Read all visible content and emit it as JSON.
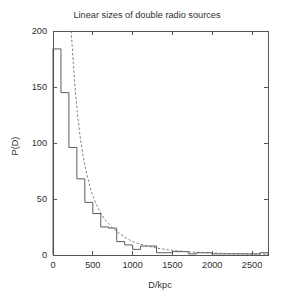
{
  "chart_data": {
    "type": "bar",
    "title": "Linear sizes of double radio sources",
    "xlabel": "D/kpc",
    "ylabel": "P(D)",
    "xlim": [
      0,
      2700
    ],
    "ylim": [
      0,
      200
    ],
    "xticks": [
      0,
      500,
      1000,
      1500,
      2000,
      2500
    ],
    "xtick_labels": [
      "0",
      "500",
      "1000",
      "1500",
      "2000",
      "2500"
    ],
    "yticks": [
      0,
      50,
      100,
      150,
      200
    ],
    "ytick_labels": [
      "0",
      "50",
      "100",
      "150",
      "200"
    ],
    "grid": false,
    "legend": "none",
    "bin_width": 100,
    "bin_edges": [
      0,
      100,
      200,
      300,
      400,
      500,
      600,
      700,
      800,
      900,
      1000,
      1100,
      1200,
      1300,
      1400,
      1500,
      1600,
      1700,
      1800,
      1900,
      2000,
      2100,
      2200,
      2300,
      2400,
      2500,
      2600,
      2700
    ],
    "categories": [
      "0-100",
      "100-200",
      "200-300",
      "300-400",
      "400-500",
      "500-600",
      "600-700",
      "700-800",
      "800-900",
      "900-1000",
      "1000-1100",
      "1100-1200",
      "1200-1300",
      "1300-1400",
      "1400-1500",
      "1500-1600",
      "1600-1700",
      "1700-1800",
      "1800-1900",
      "1900-2000",
      "2000-2100",
      "2100-2200",
      "2200-2300",
      "2300-2400",
      "2400-2500",
      "2500-2600",
      "2600-2700"
    ],
    "series": [
      {
        "name": "Observed histogram P(D)",
        "style": "step",
        "values": [
          184,
          145,
          96,
          68,
          47,
          37,
          25,
          24,
          12,
          9,
          5,
          8,
          8,
          2,
          2,
          3,
          3,
          1,
          2,
          2,
          1,
          1,
          1,
          1,
          1,
          1,
          2
        ]
      },
      {
        "name": "Model fit curve",
        "style": "dashed-line",
        "x": [
          228,
          235,
          245,
          255,
          265,
          280,
          295,
          310,
          330,
          350,
          375,
          400,
          425,
          450,
          480,
          510,
          545,
          580,
          620,
          660,
          700,
          750,
          800,
          860,
          920,
          1000,
          1080,
          1160,
          1250,
          1350,
          1450,
          1550,
          1700,
          1850,
          2000,
          2200,
          2400,
          2600,
          2700
        ],
        "y": [
          200,
          193,
          182,
          171,
          161,
          147,
          135,
          124,
          112,
          101,
          90,
          80,
          72,
          65,
          57,
          51,
          45,
          40,
          35,
          31,
          28,
          24,
          21,
          18,
          15,
          12,
          10,
          8.5,
          7,
          5.6,
          4.6,
          3.8,
          2.9,
          2.3,
          1.8,
          1.3,
          1.0,
          0.8,
          0.7
        ]
      }
    ]
  },
  "layout": {
    "plot_left": 53,
    "plot_right": 268,
    "plot_top": 31,
    "plot_bottom": 255
  },
  "colors": {
    "histogram": "#4a4a4a",
    "fit": "#6d6d6d",
    "frame": "#555555",
    "text": "#2f2f2f",
    "background": "#ffffff"
  }
}
